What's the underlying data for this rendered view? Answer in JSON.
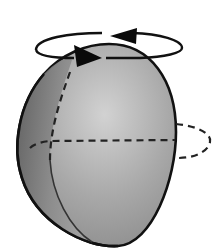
{
  "diagram": {
    "elements": {
      "body": {
        "shape": "egg-shaped ellipsoid",
        "fill_light": "#c9c9c9",
        "fill_mid": "#9a9a9a",
        "fill_dark": "#5e5e5e",
        "outline": "#111111"
      },
      "rotation_ring": {
        "shape": "ellipse",
        "direction": "counter-clockwise (viewed from above)",
        "stroke": "#111111"
      },
      "arrowheads": [
        {
          "position": "upper back",
          "points": "left"
        },
        {
          "position": "lower front",
          "points": "right"
        }
      ],
      "meridian": {
        "style": "dashed"
      },
      "equator": {
        "style": "dashed",
        "extends_beyond_right_edge": true
      }
    },
    "colors": {
      "line": "#111111",
      "background": "#ffffff"
    }
  }
}
